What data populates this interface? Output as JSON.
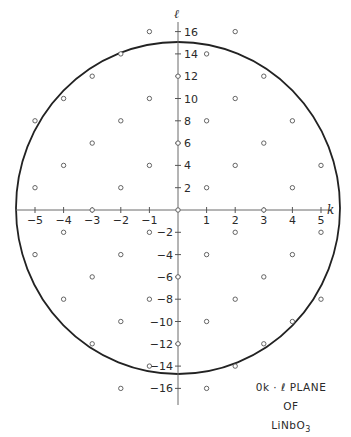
{
  "caption": {
    "line1": "0k · ℓ PLANE",
    "line2": "OF",
    "line3_main": "LiNbO",
    "line3_sub": "3"
  },
  "axes": {
    "horizontal_label": "k",
    "vertical_label": "ℓ",
    "k_ticks": [
      -5,
      -4,
      -3,
      -2,
      -1,
      1,
      2,
      3,
      4,
      5
    ],
    "l_ticks": [
      16,
      14,
      12,
      10,
      8,
      6,
      4,
      2,
      -2,
      -4,
      -6,
      -8,
      -10,
      -12,
      -14,
      -16
    ]
  },
  "layout": {
    "origin_x": 178,
    "origin_y": 210,
    "k_unit_px": 28.6,
    "l_unit_px": 11.15,
    "circle_cx": 178,
    "circle_cy": 208,
    "circle_rx": 162,
    "circle_ry": 166
  },
  "colors": {
    "boundary": "#222222",
    "axis": "#6a6a6a",
    "point_stroke": "#555555",
    "text": "#2a2a2a"
  },
  "reflections": [
    {
      "k": 0,
      "l": [
        12,
        6,
        0,
        -6,
        -12
      ]
    },
    {
      "k": 1,
      "l": [
        14,
        8,
        2,
        -4,
        -10,
        -16
      ]
    },
    {
      "k": 2,
      "l": [
        16,
        10,
        4,
        -2,
        -8,
        -14
      ]
    },
    {
      "k": 3,
      "l": [
        12,
        6,
        0,
        -6,
        -12
      ]
    },
    {
      "k": 4,
      "l": [
        8,
        2,
        -4,
        -10
      ]
    },
    {
      "k": 5,
      "l": [
        4,
        -2,
        -8
      ]
    },
    {
      "k": -1,
      "l": [
        16,
        10,
        4,
        -2,
        -8,
        -14
      ]
    },
    {
      "k": -2,
      "l": [
        14,
        8,
        2,
        -4,
        -10,
        -16
      ]
    },
    {
      "k": -3,
      "l": [
        12,
        6,
        0,
        -6,
        -12
      ]
    },
    {
      "k": -4,
      "l": [
        10,
        4,
        -2,
        -8
      ]
    },
    {
      "k": -5,
      "l": [
        8,
        2,
        -4
      ]
    }
  ]
}
